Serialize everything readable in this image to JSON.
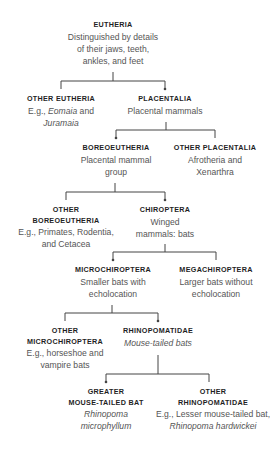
{
  "colors": {
    "title": "#1f1f1f",
    "description": "#555555",
    "line": "#444444",
    "background": "#ffffff"
  },
  "nodes": {
    "eutheria": {
      "title": [
        "EUTHERIA"
      ],
      "desc": [
        "Distinguished by details",
        "of their jaws, teeth,",
        "ankles, and feet"
      ]
    },
    "other_eutheria": {
      "title": [
        "OTHER EUTHERIA"
      ],
      "desc_prefix": "E.g., ",
      "desc_italic1": "Eomaia",
      "desc_mid": " and",
      "desc_italic2": "Juramaia"
    },
    "placentalia": {
      "title": [
        "PLACENTALIA"
      ],
      "desc": [
        "Placental mammals"
      ]
    },
    "boreoeutheria": {
      "title": [
        "BOREOEUTHERIA"
      ],
      "desc": [
        "Placental mammal",
        "group"
      ]
    },
    "other_placentalia": {
      "title": [
        "OTHER PLACENTALIA"
      ],
      "desc": [
        "Afrotheria and",
        "Xenarthra"
      ]
    },
    "other_boreoeutheria": {
      "title": [
        "OTHER",
        "BOREOEUTHERIA"
      ],
      "desc": [
        "E.g., Primates, Rodentia,",
        "and Cetacea"
      ]
    },
    "chiroptera": {
      "title": [
        "CHIROPTERA"
      ],
      "desc": [
        "Winged",
        "mammals: bats"
      ]
    },
    "microchiroptera": {
      "title": [
        "MICROCHIROPTERA"
      ],
      "desc": [
        "Smaller bats with",
        "echolocation"
      ]
    },
    "megachiroptera": {
      "title": [
        "MEGACHIROPTERA"
      ],
      "desc": [
        "Larger bats without",
        "echolocation"
      ]
    },
    "other_microchiroptera": {
      "title": [
        "OTHER",
        "MICROCHIROPTERA"
      ],
      "desc": [
        "E.g., horseshoe and",
        "vampire bats"
      ]
    },
    "rhinopomatidae": {
      "title": [
        "RHINOPOMATIDAE"
      ],
      "desc": [
        "Mouse-tailed bats"
      ]
    },
    "greater_mouse_tailed_bat": {
      "title": [
        "GREATER",
        "MOUSE-TAILED BAT"
      ],
      "desc_italic": [
        "Rhinopoma",
        "microphyllum"
      ]
    },
    "other_rhinopomatidae": {
      "title": [
        "OTHER",
        "RHINOPOMATIDAE"
      ],
      "desc": [
        "E.g., Lesser mouse-tailed bat,"
      ],
      "desc_italic": [
        "Rhinopoma hardwickei"
      ]
    }
  }
}
